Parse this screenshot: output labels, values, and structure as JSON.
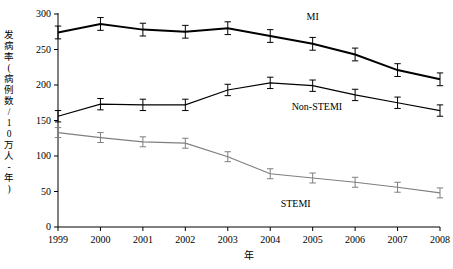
{
  "chart_data": {
    "type": "line",
    "title": "",
    "xlabel": "年",
    "ylabel": "发病率\n(病例数/10万人-年)",
    "ylabel_lines": [
      "发",
      "病",
      "率",
      "(",
      "病",
      "例",
      "数",
      "/",
      "1",
      "0",
      "万",
      "人",
      "-",
      "年",
      ")"
    ],
    "x": [
      "1999",
      "2000",
      "2001",
      "2002",
      "2003",
      "2004",
      "2005",
      "2006",
      "2007",
      "2008"
    ],
    "categories": [
      "1999",
      "2000",
      "2001",
      "2002",
      "2003",
      "2004",
      "2005",
      "2006",
      "2007",
      "2008"
    ],
    "xlim": [
      1999,
      2008
    ],
    "ylim": [
      0,
      300
    ],
    "yticks": [
      0,
      50,
      100,
      150,
      200,
      250,
      300
    ],
    "ytick_labels": [
      "0",
      "50",
      "100",
      "150",
      "200",
      "250",
      "300"
    ],
    "grid": false,
    "legend": "inline-labels",
    "series": [
      {
        "name": "MI",
        "label": "MI",
        "color": "#000000",
        "linewidth": 2,
        "marker": "none",
        "values": [
          274,
          286,
          278,
          275,
          280,
          269,
          258,
          243,
          221,
          208
        ],
        "errors": [
          9,
          9,
          9,
          9,
          9,
          9,
          9,
          9,
          9,
          9
        ]
      },
      {
        "name": "Non-STEMI",
        "label": "Non-STEMI",
        "color": "#000000",
        "linewidth": 1.2,
        "marker": "none",
        "values": [
          156,
          173,
          172,
          172,
          193,
          203,
          199,
          186,
          175,
          164
        ],
        "errors": [
          8,
          8,
          8,
          8,
          8,
          8,
          8,
          8,
          8,
          8
        ]
      },
      {
        "name": "STEMI",
        "label": "STEMI",
        "color": "#7f7f7f",
        "linewidth": 1.2,
        "marker": "none",
        "values": [
          133,
          126,
          120,
          118,
          99,
          75,
          69,
          63,
          56,
          48
        ],
        "errors": [
          7,
          7,
          7,
          7,
          7,
          7,
          7,
          7,
          7,
          7
        ]
      }
    ],
    "annotations": [
      {
        "text": "MI",
        "x": 2005,
        "y": 292
      },
      {
        "text": "Non-STEMI",
        "x": 2005.1,
        "y": 165
      },
      {
        "text": "STEMI",
        "x": 2004.6,
        "y": 28
      }
    ]
  }
}
